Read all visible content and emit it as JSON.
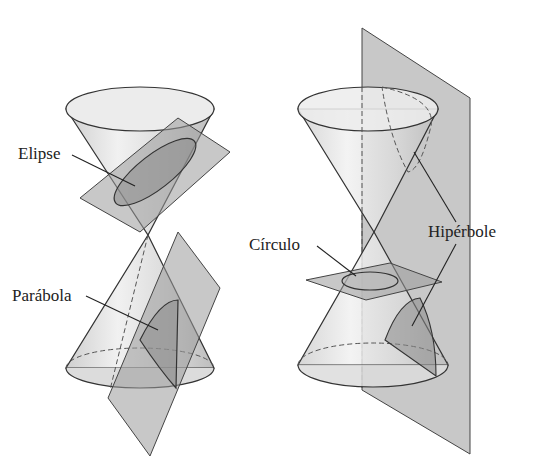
{
  "figure": {
    "labels": {
      "ellipse": "Elipse",
      "parabola": "Parábola",
      "circle": "Círculo",
      "hyperbola": "Hipérbole"
    },
    "colors": {
      "background": "#ffffff",
      "cone_fill": "#e4e4e4",
      "plane_fill": "#9a9a9a",
      "section_fill": "#8c8c8c",
      "line": "#333333"
    }
  }
}
